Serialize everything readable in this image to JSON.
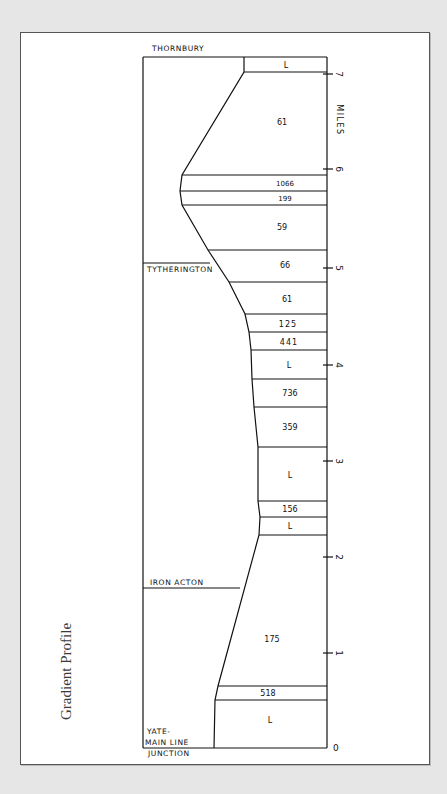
{
  "caption": "Gradient Profile",
  "axis": {
    "label": "MILES",
    "ticks": [
      "0",
      "1",
      "2",
      "3",
      "4",
      "5",
      "6",
      "7"
    ]
  },
  "stations": {
    "thornbury": "THORNBURY",
    "tytherington": "TYTHERINGTON",
    "iron_acton": "IRON ACTON",
    "yate_1": "YATE-",
    "yate_2": "MAIN LINE",
    "yate_3": "JUNCTION"
  },
  "gradients": [
    {
      "label": "L"
    },
    {
      "label": "61"
    },
    {
      "label": "1066"
    },
    {
      "label": "199"
    },
    {
      "label": "59"
    },
    {
      "label": "66"
    },
    {
      "label": "61"
    },
    {
      "label": "125"
    },
    {
      "label": "441"
    },
    {
      "label": "L"
    },
    {
      "label": "736"
    },
    {
      "label": "359"
    },
    {
      "label": "L"
    },
    {
      "label": "156"
    },
    {
      "label": "L"
    },
    {
      "label": "175"
    },
    {
      "label": "518"
    },
    {
      "label": "L"
    }
  ],
  "colors": {
    "ink": "#111111",
    "paper": "#ffffff",
    "background": "#e6e6e6"
  }
}
